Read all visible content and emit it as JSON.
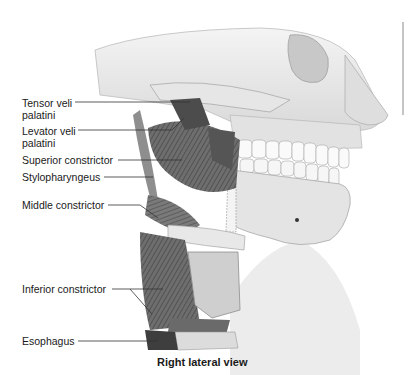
{
  "figure": {
    "caption": "Right lateral view",
    "labels": [
      {
        "id": "tensor",
        "line1": "Tensor veli",
        "line2": "palatini"
      },
      {
        "id": "levator",
        "line1": "Levator veli",
        "line2": "palatini"
      },
      {
        "id": "superior",
        "line1": "Superior constrictor"
      },
      {
        "id": "stylo",
        "line1": "Stylopharyngeus"
      },
      {
        "id": "middle",
        "line1": "Middle constrictor"
      },
      {
        "id": "inferior",
        "line1": "Inferior constrictor"
      },
      {
        "id": "esophagus",
        "line1": "Esophagus"
      }
    ]
  }
}
